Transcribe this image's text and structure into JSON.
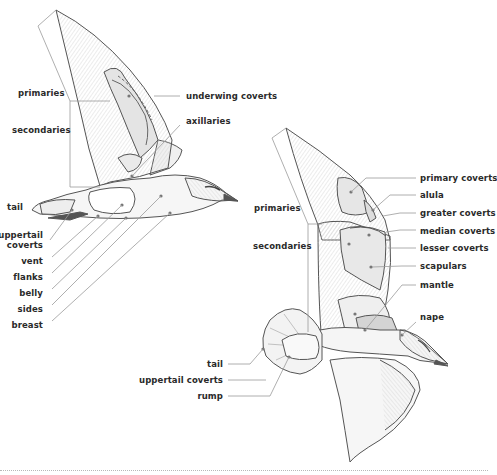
{
  "diagram": {
    "colors": {
      "outline": "#555555",
      "leader": "#9a9a9a",
      "feather_fill": "#f2f2f2",
      "shade": "#dcdcdc",
      "dark_shade": "#c9c9c9",
      "dot": "#777777",
      "label": "#2a2a2a"
    },
    "underside": {
      "labels": {
        "primaries": "primaries",
        "secondaries": "secondaries",
        "underwing_coverts": "underwing coverts",
        "axillaries": "axillaries",
        "tail": "tail",
        "uppertail_coverts_1": "uppertail",
        "uppertail_coverts_2": "coverts",
        "vent": "vent",
        "flanks": "flanks",
        "belly": "belly",
        "sides": "sides",
        "breast": "breast"
      }
    },
    "upperside": {
      "labels": {
        "primaries": "primaries",
        "secondaries": "secondaries",
        "primary_coverts": "primary coverts",
        "alula": "alula",
        "greater_coverts": "greater coverts",
        "median_coverts": "median coverts",
        "lesser_coverts": "lesser coverts",
        "scapulars": "scapulars",
        "mantle": "mantle",
        "nape": "nape",
        "tail": "tail",
        "uppertail_coverts": "uppertail coverts",
        "rump": "rump"
      }
    }
  }
}
